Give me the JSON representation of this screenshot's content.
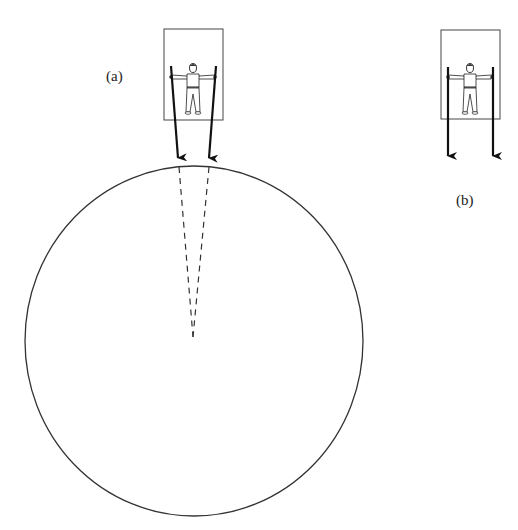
{
  "diagram": {
    "labels": {
      "a": "(a)",
      "b": "(b)"
    },
    "colors": {
      "stroke": "#222222",
      "earth_outline": "#333333",
      "background": "#ffffff"
    },
    "earth": {
      "cx": 194,
      "cy": 341,
      "rx": 169,
      "ry": 175
    },
    "panel_a": {
      "box": {
        "x": 164,
        "y": 29,
        "w": 59,
        "h": 91
      },
      "converging_to": {
        "x": 193,
        "y": 337
      }
    },
    "panel_b": {
      "box": {
        "x": 441,
        "y": 30,
        "w": 59,
        "h": 89
      }
    }
  }
}
